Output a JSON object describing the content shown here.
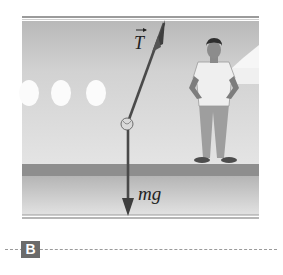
{
  "figure": {
    "panel_label": "B",
    "scene": "airplane-cabin-interior",
    "vectors": [
      {
        "id": "tension",
        "label": "T",
        "is_vector": true,
        "direction": "up-right"
      },
      {
        "id": "weight",
        "label": "mg",
        "is_vector": false,
        "direction": "down"
      }
    ],
    "elements": {
      "hanging_object": "pendulum-bob",
      "person": "standing-passenger-hands-on-hips",
      "windows": 3
    },
    "colors": {
      "cabin_wall": "#c8c8c8",
      "cabin_light": "#e6e6e6",
      "floor_band": "#8c8c8c",
      "floor_lower": "#cfcfcf",
      "vector": "#4a4a4a",
      "label_box": "#6b6b6b"
    }
  }
}
